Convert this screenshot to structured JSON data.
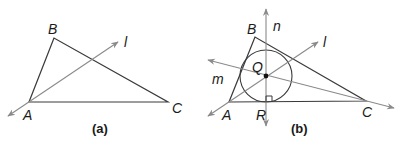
{
  "figure_a": {
    "caption": "(a)",
    "labels": {
      "B": "B",
      "A": "A",
      "C": "C",
      "l": "l"
    }
  },
  "figure_b": {
    "caption": "(b)",
    "labels": {
      "B": "B",
      "A": "A",
      "C": "C",
      "l": "l",
      "n": "n",
      "m": "m",
      "Q": "Q",
      "R": "R"
    }
  },
  "colors": {
    "triangle": "#3a3a3a",
    "rays": "#8a8a8a",
    "text": "#1a1a1a"
  }
}
